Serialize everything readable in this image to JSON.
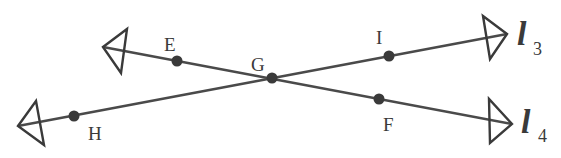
{
  "diagram": {
    "type": "intersecting-lines",
    "stroke_color": "#4a4a4a",
    "point_color": "#3a3a3a",
    "intersection": {
      "label": "G",
      "x": 272,
      "y": 78
    },
    "lines": [
      {
        "name": "l3",
        "label_main": "l",
        "label_sub": "3",
        "points": [
          "H",
          "G",
          "I"
        ],
        "start_arrow": {
          "x": 18,
          "y": 126
        },
        "end_arrow": {
          "x": 507,
          "y": 34
        }
      },
      {
        "name": "l4",
        "label_main": "l",
        "label_sub": "4",
        "points": [
          "E",
          "G",
          "F"
        ],
        "start_arrow": {
          "x": 103,
          "y": 47
        },
        "end_arrow": {
          "x": 512,
          "y": 124
        }
      }
    ],
    "points": [
      {
        "label": "E",
        "x": 177,
        "y": 61
      },
      {
        "label": "G",
        "x": 272,
        "y": 78
      },
      {
        "label": "I",
        "x": 389,
        "y": 56
      },
      {
        "label": "H",
        "x": 74,
        "y": 116
      },
      {
        "label": "F",
        "x": 379,
        "y": 99
      }
    ]
  }
}
